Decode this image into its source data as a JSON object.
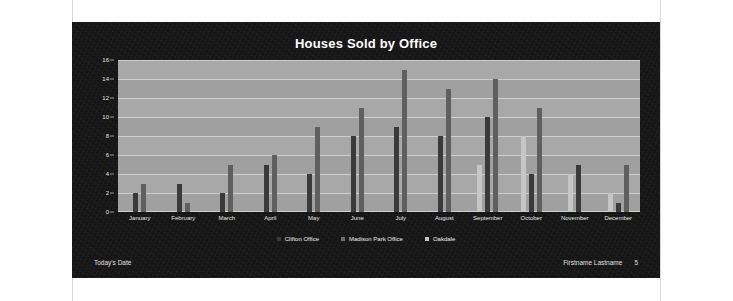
{
  "slide": {
    "title": "Houses Sold by Office",
    "footer": {
      "date_label": "Today's Date",
      "author": "Firstname Lastname",
      "page_number": "5"
    }
  },
  "colors": {
    "slide_background": "#151515",
    "plot_background": "#a8a8a8",
    "gridline": "#cfcfcf",
    "series_clifton": "#3a3a3a",
    "series_madison_park": "#5f5f5f",
    "series_oakdale": "#c6c6c6",
    "text_light": "#ffffff"
  },
  "chart_data": {
    "type": "bar",
    "title": "Houses Sold by Office",
    "xlabel": "",
    "ylabel": "",
    "ylim": [
      0,
      16
    ],
    "yticks": [
      0,
      2,
      4,
      6,
      8,
      10,
      12,
      14,
      16
    ],
    "grid": true,
    "legend_position": "bottom",
    "categories": [
      "January",
      "February",
      "March",
      "April",
      "May",
      "June",
      "July",
      "August",
      "September",
      "October",
      "November",
      "December"
    ],
    "series": [
      {
        "name": "Clifton Office",
        "color": "#3a3a3a",
        "values": [
          2,
          3,
          2,
          5,
          4,
          8,
          9,
          8,
          10,
          4,
          5,
          1
        ]
      },
      {
        "name": "Madison Park Office",
        "color": "#5f5f5f",
        "values": [
          3,
          1,
          5,
          6,
          9,
          11,
          15,
          13,
          14,
          11,
          0,
          5
        ]
      },
      {
        "name": "Oakdale",
        "color": "#c6c6c6",
        "values": [
          0,
          0,
          0,
          0,
          0,
          0,
          0,
          0,
          5,
          8,
          4,
          2
        ]
      }
    ]
  }
}
